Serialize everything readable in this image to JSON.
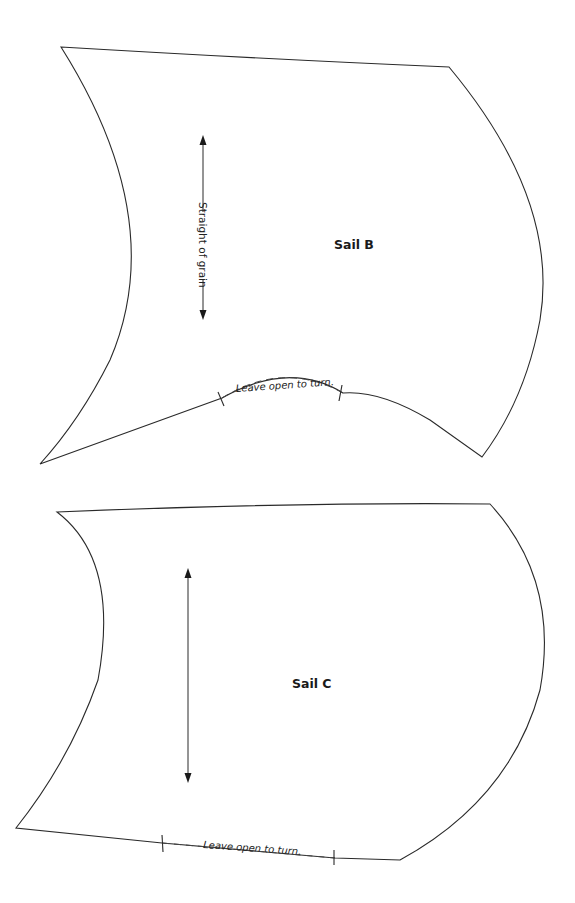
{
  "pattern_pieces": [
    {
      "id": "sail-b",
      "label": "Sail B",
      "grainline_label": "Straight of grain",
      "opening_note": "Leave open to turn."
    },
    {
      "id": "sail-c",
      "label": "Sail C",
      "grainline_label": "",
      "opening_note": "Leave open to turn."
    }
  ],
  "colors": {
    "background": "#ffffff",
    "line": "#2a2a2a"
  }
}
